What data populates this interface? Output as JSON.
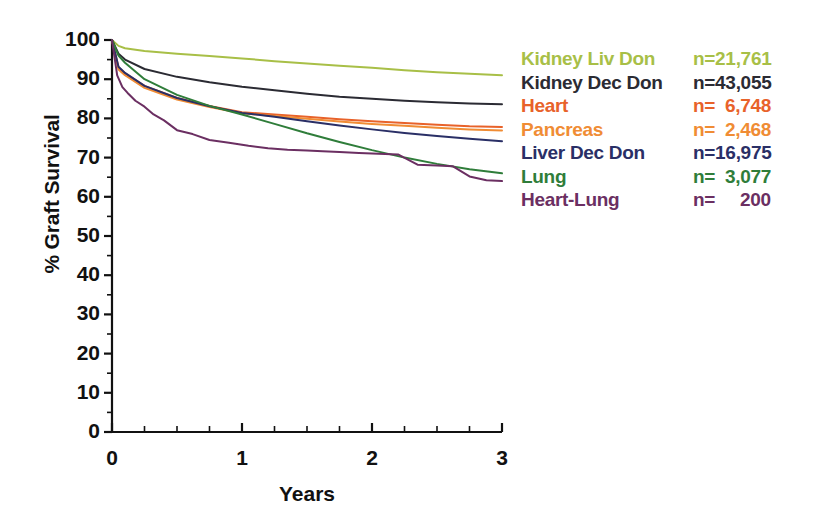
{
  "chart_data": {
    "type": "line",
    "title": "",
    "xlabel": "Years",
    "ylabel": "% Graft Survival",
    "xlim": [
      0,
      3
    ],
    "ylim": [
      0,
      100
    ],
    "x_ticks": [
      "0",
      "1",
      "2",
      "3"
    ],
    "x_tick_values": [
      0,
      1,
      2,
      3
    ],
    "x_minor_ticks": [
      0.25,
      0.5,
      0.75,
      1.25,
      1.5,
      1.75,
      2.25,
      2.5,
      2.75
    ],
    "y_ticks": [
      "100",
      "90",
      "80",
      "70",
      "60",
      "50",
      "40",
      "30",
      "20",
      "10",
      "0"
    ],
    "y_tick_values": [
      100,
      90,
      80,
      70,
      60,
      50,
      40,
      30,
      20,
      10,
      0
    ],
    "grid": false,
    "legend_position": "right",
    "series": [
      {
        "name": "Kidney Liv Don",
        "n_label": "n=21,761",
        "n": 21761,
        "color": "#a8bf47",
        "x": [
          0,
          0.05,
          0.1,
          0.25,
          0.5,
          0.75,
          1.0,
          1.25,
          1.5,
          1.75,
          2.0,
          2.25,
          2.5,
          2.75,
          3.0
        ],
        "y": [
          100,
          98.5,
          97.9,
          97.2,
          96.5,
          95.9,
          95.3,
          94.6,
          94.0,
          93.4,
          92.9,
          92.3,
          91.8,
          91.4,
          91.0
        ]
      },
      {
        "name": "Kidney Dec Don",
        "n_label": "n=43,055",
        "n": 43055,
        "color": "#2b2b33",
        "x": [
          0,
          0.05,
          0.1,
          0.25,
          0.5,
          0.75,
          1.0,
          1.25,
          1.5,
          1.75,
          2.0,
          2.25,
          2.5,
          2.75,
          3.0
        ],
        "y": [
          100,
          96.5,
          95.0,
          92.6,
          90.6,
          89.2,
          88.1,
          87.2,
          86.3,
          85.5,
          85.0,
          84.5,
          84.1,
          83.8,
          83.6
        ]
      },
      {
        "name": "Heart",
        "n_label": "n=  6,748",
        "n": 6748,
        "color": "#e8622a",
        "x": [
          0,
          0.05,
          0.1,
          0.25,
          0.5,
          0.75,
          1.0,
          1.25,
          1.5,
          1.75,
          2.0,
          2.25,
          2.5,
          2.75,
          3.0
        ],
        "y": [
          100,
          93.0,
          91.5,
          88.3,
          85.2,
          83.2,
          81.6,
          81.0,
          80.4,
          79.8,
          79.3,
          78.8,
          78.4,
          78.0,
          77.8
        ]
      },
      {
        "name": "Pancreas",
        "n_label": "n=  2,468",
        "n": 2468,
        "color": "#f08c34",
        "x": [
          0,
          0.05,
          0.1,
          0.25,
          0.5,
          0.75,
          1.0,
          1.25,
          1.5,
          1.75,
          2.0,
          2.25,
          2.5,
          2.75,
          3.0
        ],
        "y": [
          100,
          92.5,
          91.0,
          87.8,
          84.8,
          82.9,
          81.3,
          80.6,
          79.9,
          79.2,
          78.6,
          78.1,
          77.6,
          77.2,
          76.9
        ]
      },
      {
        "name": "Liver Dec Don",
        "n_label": "n=16,975",
        "n": 16975,
        "color": "#2a2f66",
        "x": [
          0,
          0.05,
          0.1,
          0.25,
          0.5,
          0.75,
          1.0,
          1.25,
          1.5,
          1.75,
          2.0,
          2.25,
          2.5,
          2.75,
          3.0
        ],
        "y": [
          100,
          93.2,
          91.6,
          88.3,
          85.2,
          83.1,
          81.4,
          80.4,
          79.3,
          78.2,
          77.2,
          76.3,
          75.5,
          74.8,
          74.2
        ]
      },
      {
        "name": "Lung",
        "n_label": "n=  3,077",
        "n": 3077,
        "color": "#2f7d3a",
        "x": [
          0,
          0.05,
          0.1,
          0.25,
          0.5,
          0.75,
          1.0,
          1.25,
          1.5,
          1.75,
          2.0,
          2.25,
          2.5,
          2.75,
          3.0
        ],
        "y": [
          100,
          96.0,
          94.2,
          90.0,
          86.0,
          83.2,
          81.0,
          78.6,
          76.2,
          74.0,
          71.9,
          70.0,
          68.4,
          67.0,
          66.0
        ]
      },
      {
        "name": "Heart-Lung",
        "n_label": "n=     200",
        "n": 200,
        "color": "#6b2f62",
        "x": [
          0,
          0.04,
          0.08,
          0.12,
          0.18,
          0.25,
          0.32,
          0.4,
          0.5,
          0.62,
          0.75,
          0.9,
          1.05,
          1.2,
          1.35,
          1.5,
          1.62,
          1.75,
          1.9,
          2.05,
          2.2,
          2.35,
          2.5,
          2.62,
          2.75,
          2.88,
          3.0
        ],
        "y": [
          100,
          91.0,
          88.0,
          86.5,
          84.5,
          83.0,
          81.0,
          79.5,
          77.0,
          76.0,
          74.5,
          73.8,
          73.0,
          72.4,
          72.0,
          71.8,
          71.6,
          71.4,
          71.2,
          71.0,
          70.8,
          68.2,
          68.0,
          67.8,
          65.2,
          64.2,
          64.0
        ]
      }
    ]
  },
  "legend": {
    "rows": [
      {
        "label": "Kidney Liv Don",
        "n": "n=21,761",
        "color": "#a8bf47"
      },
      {
        "label": "Kidney Dec Don",
        "n": "n=43,055",
        "color": "#2b2b33"
      },
      {
        "label": "Heart",
        "n": "n=  6,748",
        "color": "#e8622a"
      },
      {
        "label": "Pancreas",
        "n": "n=  2,468",
        "color": "#f08c34"
      },
      {
        "label": "Liver Dec Don",
        "n": "n=16,975",
        "color": "#2a2f66"
      },
      {
        "label": "Lung",
        "n": "n=  3,077",
        "color": "#2f7d3a"
      },
      {
        "label": "Heart-Lung",
        "n": "n=     200",
        "color": "#6b2f62"
      }
    ]
  },
  "axes": {
    "y_title": "% Graft Survival",
    "x_title": "Years"
  }
}
